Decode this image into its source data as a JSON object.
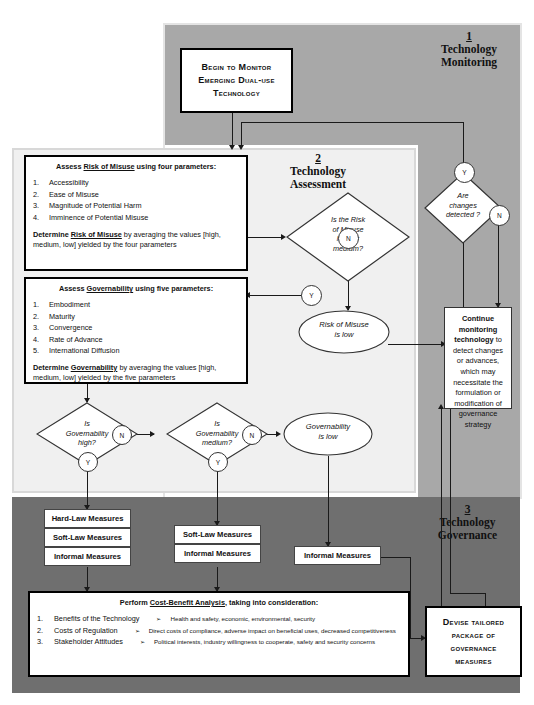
{
  "diagram": {
    "colors": {
      "section1_bg": "#a8a8a8",
      "section2_bg": "#f0f0f0",
      "section3_bg": "#6f6f6f",
      "box_bg": "#ffffff",
      "line": "#1a1a1a"
    }
  },
  "sections": [
    {
      "number": "1",
      "line1": "Technology",
      "line2": "Monitoring"
    },
    {
      "number": "2",
      "line1": "Technology",
      "line2": "Assessment"
    },
    {
      "number": "3",
      "line1": "Technology",
      "line2": "Governance"
    }
  ],
  "start_box": {
    "line1": "Begin to Monitor",
    "line2": "Emerging Dual-use",
    "line3": "Technology"
  },
  "risk_box": {
    "heading_pre": "Assess ",
    "heading_term": "Risk of Misuse",
    "heading_post": " using four parameters:",
    "items": [
      {
        "n": "1.",
        "text": "Accessibility"
      },
      {
        "n": "2.",
        "text": "Ease of Misuse"
      },
      {
        "n": "3.",
        "text": "Magnitude of Potential Harm"
      },
      {
        "n": "4.",
        "text": "Imminence of Potential Misuse"
      }
    ],
    "tail_pre": "Determine ",
    "tail_term": "Risk of Misuse",
    "tail_post": " by averaging the values [high, medium, low] yielded by the four parameters"
  },
  "gov_box": {
    "heading_pre": "Assess ",
    "heading_term": "Governability",
    "heading_post": " using five parameters:",
    "items": [
      {
        "n": "1.",
        "text": "Embodiment"
      },
      {
        "n": "2.",
        "text": "Maturity"
      },
      {
        "n": "3.",
        "text": "Convergence"
      },
      {
        "n": "4.",
        "text": "Rate of Advance"
      },
      {
        "n": "5.",
        "text": "International Diffusion"
      }
    ],
    "tail_pre": "Determine ",
    "tail_term": "Governability",
    "tail_post": " by averaging the values [high, medium, low] yielded by the five parameters"
  },
  "decisions": {
    "risk": {
      "l1": "Is the Risk",
      "l2": "of Misuse",
      "l3": "high or",
      "l4": "medium?",
      "yes": "Y",
      "no": "N"
    },
    "changes": {
      "l1": "Are",
      "l2": "changes",
      "l3": "detected ?",
      "yes": "Y",
      "no": "N"
    },
    "gov_high": {
      "l1": "Is",
      "l2": "Governability",
      "l3": "high?",
      "yes": "Y",
      "no": "N"
    },
    "gov_medium": {
      "l1": "Is",
      "l2": "Governability",
      "l3": "medium?",
      "yes": "Y",
      "no": "N"
    }
  },
  "outcomes": {
    "risk_low": {
      "l1": "Risk of Misuse",
      "l2": "is low"
    },
    "gov_low": {
      "l1": "Governability",
      "l2": "is low"
    }
  },
  "continue_box": {
    "bold": "Continue monitoring technology",
    "rest": " to detect changes or advances, which may necessitate the formulation or modification of governance strategy"
  },
  "measure_groups": [
    {
      "id": "high",
      "items": [
        "Hard-Law Measures",
        "Soft-Law Measures",
        "Informal Measures"
      ]
    },
    {
      "id": "medium",
      "items": [
        "Soft-Law Measures",
        "Informal Measures"
      ]
    },
    {
      "id": "low",
      "items": [
        "Informal Measures"
      ]
    }
  ],
  "cost_benefit": {
    "heading_pre": "Perform ",
    "heading_term": "Cost-Benefit Analysis",
    "heading_post": ", taking into consideration:",
    "items": [
      {
        "n": "1.",
        "text": "Benefits of the Technology",
        "sub": "Health and safety, economic, environmental, security"
      },
      {
        "n": "2.",
        "text": "Costs of Regulation",
        "sub": "Direct costs of compliance, adverse impact on beneficial uses, decreased competitiveness"
      },
      {
        "n": "3.",
        "text": "Stakeholder Attitudes",
        "sub": "Political interests, industry willingness to cooperate, safety and security concerns"
      }
    ]
  },
  "devise_box": {
    "line1": "Devise tailored",
    "line2": "package of",
    "line3": "governance",
    "line4": "measures"
  }
}
